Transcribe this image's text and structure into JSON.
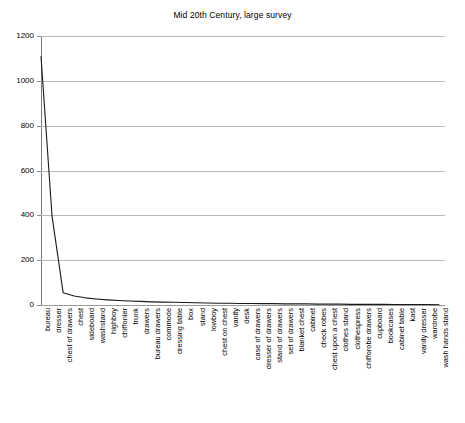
{
  "chart_data": {
    "type": "line",
    "title": "Mid 20th Century, large survey",
    "xlabel": "",
    "ylabel": "",
    "ylim": [
      0,
      1200
    ],
    "yticks": [
      0,
      200,
      400,
      600,
      800,
      1000,
      1200
    ],
    "grid": true,
    "legend": "none",
    "categories": [
      "bureau",
      "dresser",
      "chest of drawers",
      "chest",
      "sideboard",
      "washstand",
      "highboy",
      "chiffonier",
      "trunk",
      "drawers",
      "bureau drawers",
      "commode",
      "dressing table",
      "box",
      "stand",
      "lowboy",
      "chest on chest",
      "vanity",
      "desk",
      "case of drawers",
      "dresser of drawers",
      "stand of drawers",
      "set of drawers",
      "blanket chest",
      "cabinet",
      "check robes",
      "chest upon a chest",
      "clothes stand",
      "clothespress",
      "chifforobe drawers",
      "cupboard",
      "bookcases",
      "cabinet table",
      "kast",
      "vanity dresser",
      "wardrobe",
      "wash hands stand"
    ],
    "values": [
      1110,
      395,
      55,
      40,
      32,
      27,
      23,
      20,
      18,
      16,
      14,
      13,
      12,
      11,
      10,
      9,
      8,
      8,
      7,
      7,
      6,
      6,
      5,
      5,
      5,
      4,
      4,
      4,
      3,
      3,
      3,
      3,
      2,
      2,
      2,
      2,
      1
    ],
    "series_color": "#1a1a1a"
  },
  "axis": {
    "y_tick_labels": [
      "1200",
      "1000",
      "800",
      "600",
      "400",
      "200",
      "0"
    ]
  }
}
